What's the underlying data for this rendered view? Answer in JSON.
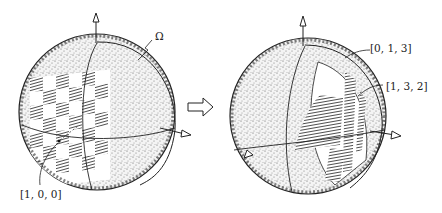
{
  "figure": {
    "left_sphere": {
      "label_omega": "Ω",
      "label_point": "[1, 0, 0]"
    },
    "transform_arrow": "⇨",
    "right_sphere": {
      "label_top": "[0, 1, 3]",
      "label_mid": "[1, 3, 2]"
    }
  },
  "colors": {
    "ink": "#222222",
    "paper": "#ffffff",
    "stipple": "#555555"
  }
}
